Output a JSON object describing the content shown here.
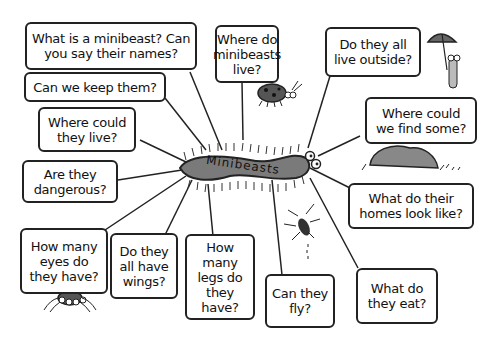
{
  "diagram": {
    "type": "mind-map",
    "center": {
      "label": "Minibeasts",
      "shape": "centipede",
      "color": "#7a7a7a"
    },
    "nodes": [
      {
        "id": "q1",
        "text": "What is a minibeast? Can\nyou say their names?"
      },
      {
        "id": "q2",
        "text": "Where do\nminibeasts\nlive?"
      },
      {
        "id": "q3",
        "text": "Do they all\nlive outside?"
      },
      {
        "id": "q4",
        "text": "Can we keep them?"
      },
      {
        "id": "q5",
        "text": "Where could\nthey live?"
      },
      {
        "id": "q6",
        "text": "Where could\nwe find some?"
      },
      {
        "id": "q7",
        "text": "Are they\ndangerous?"
      },
      {
        "id": "q8",
        "text": "What do their\nhomes look like?"
      },
      {
        "id": "q9",
        "text": "How many\neyes do\nthey have?"
      },
      {
        "id": "q10",
        "text": "Do they\nall have\nwings?"
      },
      {
        "id": "q11",
        "text": "How many\nlegs do\nthey\nhave?"
      },
      {
        "id": "q12",
        "text": "Can they\nfly?"
      },
      {
        "id": "q13",
        "text": "What do\nthey eat?"
      }
    ],
    "illustrations": [
      "ladybird-icon",
      "woodlouse-with-umbrella-icon",
      "rock-icon",
      "spider-icon",
      "flying-insect-icon"
    ]
  }
}
